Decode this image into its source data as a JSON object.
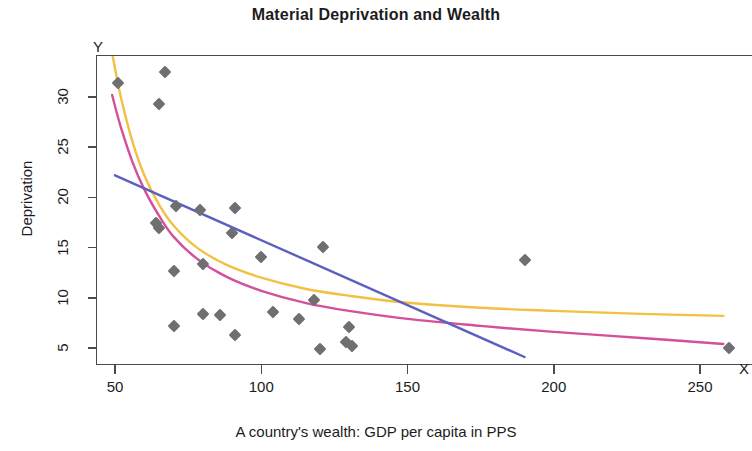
{
  "chart": {
    "title": "Material Deprivation and Wealth",
    "y_axis_letter": "Y",
    "x_axis_letter": "X"
  },
  "chart_data": {
    "type": "scatter",
    "title": "Material Deprivation and Wealth",
    "xlabel": "A country's wealth: GDP per capita in PPS",
    "ylabel": "Deprivation",
    "xlim": [
      36,
      265
    ],
    "ylim": [
      3.2,
      34.5
    ],
    "xticks": [
      50,
      100,
      150,
      200,
      250
    ],
    "yticks": [
      5,
      10,
      15,
      20,
      25,
      30
    ],
    "grid": false,
    "legend": "none",
    "points": [
      {
        "x": 51,
        "y": 31.4
      },
      {
        "x": 67,
        "y": 32.5
      },
      {
        "x": 65,
        "y": 29.3
      },
      {
        "x": 64,
        "y": 17.5
      },
      {
        "x": 65,
        "y": 17.0
      },
      {
        "x": 71,
        "y": 19.1
      },
      {
        "x": 70,
        "y": 12.7
      },
      {
        "x": 70,
        "y": 7.2
      },
      {
        "x": 79,
        "y": 18.7
      },
      {
        "x": 80,
        "y": 13.4
      },
      {
        "x": 80,
        "y": 8.4
      },
      {
        "x": 86,
        "y": 8.3
      },
      {
        "x": 91,
        "y": 18.9
      },
      {
        "x": 90,
        "y": 16.5
      },
      {
        "x": 91,
        "y": 6.3
      },
      {
        "x": 100,
        "y": 14.1
      },
      {
        "x": 104,
        "y": 8.6
      },
      {
        "x": 113,
        "y": 7.9
      },
      {
        "x": 118,
        "y": 9.8
      },
      {
        "x": 120,
        "y": 4.9
      },
      {
        "x": 121,
        "y": 15.1
      },
      {
        "x": 129,
        "y": 5.6
      },
      {
        "x": 131,
        "y": 5.2
      },
      {
        "x": 130,
        "y": 7.1
      },
      {
        "x": 190,
        "y": 13.8
      },
      {
        "x": 260,
        "y": 5.0
      }
    ],
    "curves": [
      {
        "name": "yellow-fit",
        "color": "#F2C043",
        "points": [
          {
            "x": 49,
            "y": 34.4
          },
          {
            "x": 52,
            "y": 30.0
          },
          {
            "x": 56,
            "y": 25.5
          },
          {
            "x": 60,
            "y": 22.2
          },
          {
            "x": 65,
            "y": 19.3
          },
          {
            "x": 70,
            "y": 17.2
          },
          {
            "x": 78,
            "y": 15.0
          },
          {
            "x": 88,
            "y": 13.3
          },
          {
            "x": 100,
            "y": 12.0
          },
          {
            "x": 115,
            "y": 10.9
          },
          {
            "x": 130,
            "y": 10.2
          },
          {
            "x": 150,
            "y": 9.5
          },
          {
            "x": 175,
            "y": 9.0
          },
          {
            "x": 200,
            "y": 8.7
          },
          {
            "x": 230,
            "y": 8.4
          },
          {
            "x": 258,
            "y": 8.2
          }
        ]
      },
      {
        "name": "magenta-fit",
        "color": "#D4509A",
        "points": [
          {
            "x": 49,
            "y": 30.2
          },
          {
            "x": 52,
            "y": 27.0
          },
          {
            "x": 56,
            "y": 23.5
          },
          {
            "x": 60,
            "y": 20.8
          },
          {
            "x": 65,
            "y": 18.2
          },
          {
            "x": 70,
            "y": 16.1
          },
          {
            "x": 78,
            "y": 13.9
          },
          {
            "x": 88,
            "y": 12.1
          },
          {
            "x": 100,
            "y": 10.7
          },
          {
            "x": 115,
            "y": 9.5
          },
          {
            "x": 130,
            "y": 8.7
          },
          {
            "x": 150,
            "y": 7.9
          },
          {
            "x": 175,
            "y": 7.2
          },
          {
            "x": 200,
            "y": 6.6
          },
          {
            "x": 230,
            "y": 6.0
          },
          {
            "x": 258,
            "y": 5.4
          }
        ]
      },
      {
        "name": "blue-fit",
        "color": "#5B5FC0",
        "points": [
          {
            "x": 50,
            "y": 22.2
          },
          {
            "x": 190,
            "y": 4.1
          }
        ]
      }
    ]
  },
  "axes": {
    "y_title": "Deprivation",
    "x_title": "A country's wealth: GDP per capita in PPS",
    "y_tick_labels": [
      "5",
      "10",
      "15",
      "20",
      "25",
      "30"
    ],
    "x_tick_labels": [
      "50",
      "100",
      "150",
      "200",
      "250"
    ]
  },
  "colors": {
    "marker": "#6f6f72",
    "yellow_curve": "#F2C043",
    "magenta_curve": "#D4509A",
    "blue_curve": "#5B5FC0",
    "axis": "#4a4a50"
  }
}
